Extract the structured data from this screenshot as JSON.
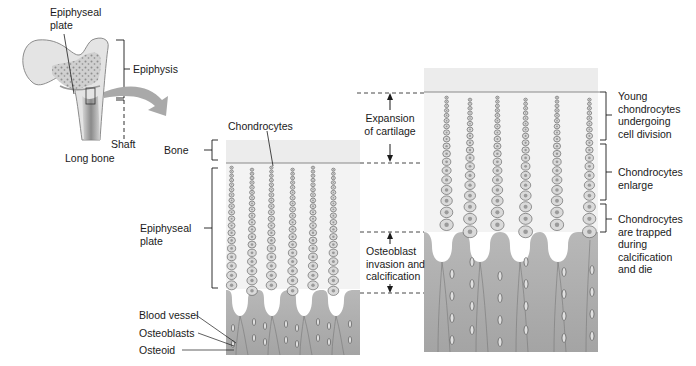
{
  "long_bone_inset": {
    "labels": {
      "epiphyseal_plate": [
        "Epiphyseal",
        "plate"
      ],
      "epiphysis": "Epiphysis",
      "shaft": "Shaft",
      "long_bone": "Long bone"
    }
  },
  "left_panel": {
    "labels": {
      "chondrocytes": "Chondrocytes",
      "bone": "Bone",
      "epiphyseal_plate": [
        "Epiphyseal",
        "plate"
      ],
      "blood_vessel": "Blood vessel",
      "osteoblasts": "Osteoblasts",
      "osteoid": "Osteoid"
    }
  },
  "middle_annotations": {
    "expansion": [
      "Expansion",
      "of cartilage"
    ],
    "osteoblast": [
      "Osteoblast",
      "invasion and",
      "calcification"
    ]
  },
  "right_panel": {
    "zones": [
      {
        "label": [
          "Young",
          "chondrocytes",
          "undergoing",
          "cell division"
        ]
      },
      {
        "label": [
          "Chondrocytes",
          "enlarge"
        ]
      },
      {
        "label": [
          "Chondrocytes",
          "are trapped",
          "during",
          "calcification",
          "and die"
        ]
      }
    ]
  },
  "colors": {
    "bone_zone": "#ececec",
    "cartilage_bg": "#f2f2f2",
    "calcified": "#b3b3b3",
    "calcified_light": "#cfcfcf",
    "cell_fill": "#d8d8d8",
    "cell_stroke": "#555555",
    "arrow": "#a9a9a9"
  }
}
